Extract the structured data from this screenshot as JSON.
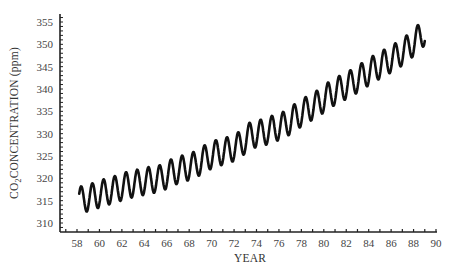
{
  "chart_data": {
    "type": "line",
    "title": "",
    "xlabel": "YEAR",
    "ylabel": "CO2 CONCENTRATION (ppm)",
    "ylabel_parts": {
      "pre": "CO",
      "sub": "2",
      "post": "CONCENTRATION (ppm)"
    },
    "xlim": [
      1957,
      1990
    ],
    "ylim": [
      308.5,
      357
    ],
    "x_tick_labels": [
      "58",
      "60",
      "62",
      "64",
      "66",
      "68",
      "70",
      "72",
      "74",
      "76",
      "78",
      "80",
      "82",
      "84",
      "86",
      "88",
      "90"
    ],
    "x_tick_values": [
      1958,
      1960,
      1962,
      1964,
      1966,
      1968,
      1970,
      1972,
      1974,
      1976,
      1978,
      1980,
      1982,
      1984,
      1986,
      1988,
      1990
    ],
    "y_tick_values": [
      310,
      315,
      320,
      325,
      330,
      335,
      340,
      345,
      350,
      355
    ],
    "y_tick_labels": [
      "310",
      "315",
      "320",
      "325",
      "330",
      "335",
      "340",
      "345",
      "350",
      "355"
    ],
    "grid": false,
    "legend": null,
    "series": [
      {
        "name": "Mauna Loa CO2 (seasonal cycle)",
        "annual_mean_years": [
          1958,
          1959,
          1960,
          1961,
          1962,
          1963,
          1964,
          1965,
          1966,
          1967,
          1968,
          1969,
          1970,
          1971,
          1972,
          1973,
          1974,
          1975,
          1976,
          1977,
          1978,
          1979,
          1980,
          1981,
          1982,
          1983,
          1984,
          1985,
          1986,
          1987,
          1988
        ],
        "annual_mean_values": [
          315.3,
          316.0,
          316.9,
          317.6,
          318.5,
          319.0,
          319.6,
          320.0,
          321.4,
          322.2,
          323.0,
          324.6,
          325.7,
          326.3,
          327.5,
          329.7,
          330.2,
          331.1,
          332.0,
          333.8,
          335.4,
          336.8,
          338.7,
          340.1,
          341.4,
          343.0,
          344.6,
          346.0,
          347.4,
          349.2,
          351.6
        ],
        "seasonal_amplitude": 3.0,
        "start_year": 1958.2,
        "end_year": 1989.0,
        "end_value": 350.0
      }
    ]
  }
}
